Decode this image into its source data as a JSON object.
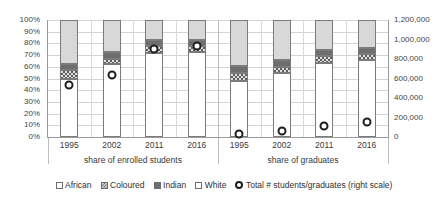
{
  "chart_data": {
    "type": "bar",
    "title": "",
    "subtitle": "",
    "xlabel": "",
    "ylabel": "",
    "grid": true,
    "legend_position": "bottom",
    "categories": [
      "1995",
      "2002",
      "2011",
      "2016",
      "1995",
      "2002",
      "2011",
      "2016"
    ],
    "panels": [
      {
        "label": "share of enrolled students",
        "categories": [
          "1995",
          "2002",
          "2011",
          "2016"
        ]
      },
      {
        "label": "share of graduates",
        "categories": [
          "1995",
          "2002",
          "2011",
          "2016"
        ]
      }
    ],
    "left_axis": {
      "label": "",
      "ylim": [
        0,
        100
      ],
      "unit": "%",
      "ticks": [
        "0%",
        "10%",
        "20%",
        "30%",
        "40%",
        "50%",
        "60%",
        "70%",
        "80%",
        "90%",
        "100%"
      ],
      "tick_values": [
        0,
        10,
        20,
        30,
        40,
        50,
        60,
        70,
        80,
        90,
        100
      ]
    },
    "right_axis": {
      "label": "right scale",
      "ylim": [
        0,
        1200000
      ],
      "ticks": [
        "0",
        "200,000",
        "400,000",
        "600,000",
        "800,000",
        "1,000,000",
        "1,200,000"
      ],
      "tick_values": [
        0,
        200000,
        400000,
        600000,
        800000,
        1000000,
        1200000
      ]
    },
    "series": [
      {
        "name": "African",
        "key": "african",
        "values": [
          50,
          62,
          72,
          73,
          48,
          55,
          63,
          66
        ]
      },
      {
        "name": "Coloured",
        "key": "coloured",
        "values": [
          7,
          5,
          6,
          5,
          7,
          5,
          6,
          5
        ]
      },
      {
        "name": "Indian",
        "key": "indian",
        "values": [
          5,
          6,
          5,
          5,
          6,
          6,
          5,
          5
        ]
      },
      {
        "name": "White",
        "key": "white",
        "values": [
          38,
          27,
          17,
          17,
          39,
          34,
          26,
          24
        ]
      }
    ],
    "marker_series": {
      "name": "Total # students/graduates (right scale)",
      "axis": "right",
      "values": [
        575000,
        680000,
        950000,
        975000,
        80000,
        110000,
        160000,
        205000
      ],
      "values_percent_of_left_axis": [
        48,
        57,
        79,
        81,
        13,
        16,
        19,
        22
      ]
    },
    "legend": [
      {
        "label": "African",
        "swatch": "african-swatch"
      },
      {
        "label": "Coloured",
        "swatch": "coloured-swatch"
      },
      {
        "label": "Indian",
        "swatch": "indian-swatch"
      },
      {
        "label": "White",
        "swatch": "white-swatch"
      },
      {
        "label": "Total # students/graduates (right scale)",
        "swatch": "circle-marker-swatch"
      }
    ],
    "colors": {
      "african": "#ffffff",
      "coloured": "#5d5d5d",
      "indian": "#6e6e6e",
      "white": "#d8d8d8",
      "marker_outline": "#1f1f1f",
      "gridline": "#d4d4d4",
      "axis": "#9a9a9a"
    }
  }
}
